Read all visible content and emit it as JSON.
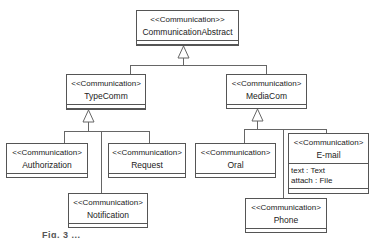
{
  "diagram": {
    "type": "UML class diagram",
    "classes": [
      {
        "id": "abstract",
        "stereotype": "<<Communication>>",
        "name": "CommunicationAbstract",
        "attributes": []
      },
      {
        "id": "typecomm",
        "stereotype": "<<Communication>",
        "name": "TypeComm",
        "attributes": []
      },
      {
        "id": "mediacom",
        "stereotype": "<<Communication>",
        "name": "MediaCom",
        "attributes": []
      },
      {
        "id": "authorization",
        "stereotype": "<<Communication>",
        "name": "Authorization",
        "attributes": []
      },
      {
        "id": "request",
        "stereotype": "<<Communication>",
        "name": "Request",
        "attributes": []
      },
      {
        "id": "notification",
        "stereotype": "<<Communication>",
        "name": "Notification",
        "attributes": []
      },
      {
        "id": "oral",
        "stereotype": "<<Communication>",
        "name": "Oral",
        "attributes": []
      },
      {
        "id": "email",
        "stereotype": "<<Communication>",
        "name": "E-mail",
        "attributes": [
          "text : Text",
          "attach : File"
        ]
      },
      {
        "id": "phone",
        "stereotype": "<<Communication>",
        "name": "Phone",
        "attributes": []
      }
    ],
    "generalizations": [
      {
        "child": "typecomm",
        "parent": "abstract"
      },
      {
        "child": "mediacom",
        "parent": "abstract"
      },
      {
        "child": "authorization",
        "parent": "typecomm"
      },
      {
        "child": "request",
        "parent": "typecomm"
      },
      {
        "child": "notification",
        "parent": "typecomm"
      },
      {
        "child": "oral",
        "parent": "mediacom"
      },
      {
        "child": "email",
        "parent": "mediacom"
      },
      {
        "child": "phone",
        "parent": "mediacom"
      }
    ],
    "caption": "Fig. 3 ..."
  },
  "colors": {
    "line": "#555555",
    "text": "#222222",
    "background": "#ffffff"
  }
}
